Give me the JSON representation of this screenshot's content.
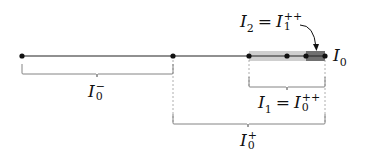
{
  "diagram": {
    "type": "interval-nesting-diagram",
    "main_line": {
      "y": 56,
      "x_start": 22,
      "x_end": 325,
      "color": "#222222"
    },
    "points": [
      {
        "id": "p0",
        "x": 22
      },
      {
        "id": "p1",
        "x": 173
      },
      {
        "id": "p2",
        "x": 249
      },
      {
        "id": "p3",
        "x": 287
      },
      {
        "id": "p4",
        "x": 306
      },
      {
        "id": "p5",
        "x": 325
      }
    ],
    "shaded_regions": [
      {
        "id": "I1-band",
        "x_start": 249,
        "x_end": 325,
        "color": "#c8c8c8"
      },
      {
        "id": "I2-band",
        "x_start": 306,
        "x_end": 325,
        "color": "#6f6f6f"
      }
    ],
    "labels": {
      "I0": {
        "base": "I",
        "sub": "0"
      },
      "I0_minus": {
        "base": "I",
        "sub": "0",
        "sup": "−"
      },
      "I0_plus": {
        "base": "I",
        "sub": "0",
        "sup": "+"
      },
      "I1_eq": {
        "lhs_base": "I",
        "lhs_sub": "1",
        "eq": "=",
        "rhs_base": "I",
        "rhs_sub": "0",
        "rhs_sup": "++"
      },
      "I2_eq": {
        "lhs_base": "I",
        "lhs_sub": "2",
        "eq": "=",
        "rhs_base": "I",
        "rhs_sub": "1",
        "rhs_sup": "++"
      }
    },
    "braces": [
      {
        "id": "brace-I0-minus",
        "x_start": 22,
        "x_end": 173,
        "y": 74,
        "label": "I0_minus"
      },
      {
        "id": "brace-I1",
        "x_start": 249,
        "x_end": 325,
        "y": 87,
        "label": "I1_eq"
      },
      {
        "id": "brace-I0-plus",
        "x_start": 173,
        "x_end": 325,
        "y": 124,
        "label": "I0_plus"
      }
    ],
    "arrow": {
      "from_label": "I2_eq",
      "to_region": "I2-band"
    }
  }
}
